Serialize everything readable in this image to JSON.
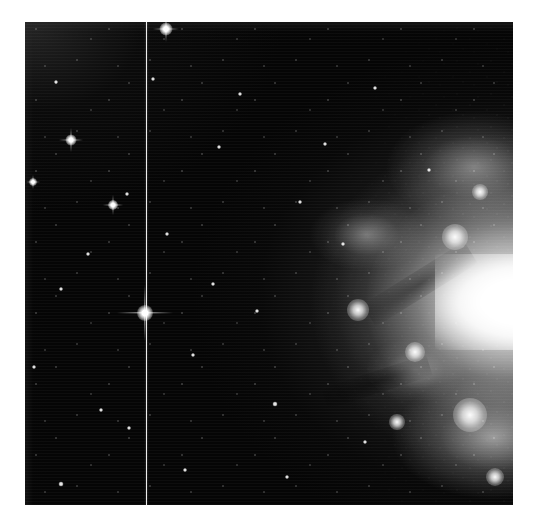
{
  "image": {
    "kind": "astronomical-photograph",
    "palette": "grayscale",
    "background_color": "#ffffff",
    "sky_color": "#050505",
    "highlight_color": "#ffffff",
    "frame": {
      "left": 25,
      "top": 22,
      "width": 488,
      "height": 483
    },
    "canvas": {
      "width": 535,
      "height": 526
    }
  },
  "features": {
    "nebula": {
      "label": "bright-galaxy-glow",
      "core_x_pct": 99,
      "core_y_pct": 58,
      "description": "saturated white core at right edge with diffuse halo fading to the left"
    },
    "column_artifact": {
      "label": "vertical-detector-column",
      "x": 121,
      "color": "#ececec"
    },
    "bright_stars": [
      {
        "name": "star-top-center",
        "x": 141,
        "y": 7,
        "size": 13,
        "spike": 26,
        "thickness": 1
      },
      {
        "name": "star-upper-left",
        "x": 46,
        "y": 118,
        "size": 11,
        "spike": 24,
        "thickness": 1
      },
      {
        "name": "star-left-mid",
        "x": 88,
        "y": 183,
        "size": 10,
        "spike": 20,
        "thickness": 1
      },
      {
        "name": "star-center-left",
        "x": 120,
        "y": 291,
        "size": 16,
        "spike": 56,
        "thickness": 1.4
      },
      {
        "name": "star-left-edge",
        "x": 8,
        "y": 160,
        "size": 8,
        "spike": 14,
        "thickness": 1
      }
    ],
    "medium_stars": [
      {
        "x": 31,
        "y": 60,
        "size": 4
      },
      {
        "x": 63,
        "y": 232,
        "size": 4
      },
      {
        "x": 102,
        "y": 172,
        "size": 4
      },
      {
        "x": 36,
        "y": 267,
        "size": 4
      },
      {
        "x": 9,
        "y": 345,
        "size": 4
      },
      {
        "x": 104,
        "y": 406,
        "size": 4
      },
      {
        "x": 160,
        "y": 448,
        "size": 4
      },
      {
        "x": 36,
        "y": 462,
        "size": 5
      },
      {
        "x": 128,
        "y": 57,
        "size": 4
      },
      {
        "x": 194,
        "y": 125,
        "size": 4
      },
      {
        "x": 232,
        "y": 289,
        "size": 4
      },
      {
        "x": 250,
        "y": 382,
        "size": 5
      },
      {
        "x": 300,
        "y": 122,
        "size": 4
      },
      {
        "x": 318,
        "y": 222,
        "size": 4
      },
      {
        "x": 168,
        "y": 333,
        "size": 4
      },
      {
        "x": 215,
        "y": 72,
        "size": 4
      },
      {
        "x": 275,
        "y": 180,
        "size": 4
      },
      {
        "x": 350,
        "y": 66,
        "size": 4
      },
      {
        "x": 404,
        "y": 148,
        "size": 4
      },
      {
        "x": 76,
        "y": 388,
        "size": 4
      },
      {
        "x": 142,
        "y": 212,
        "size": 4
      },
      {
        "x": 262,
        "y": 455,
        "size": 4
      },
      {
        "x": 340,
        "y": 420,
        "size": 4
      },
      {
        "x": 188,
        "y": 262,
        "size": 4
      }
    ],
    "knots": [
      {
        "name": "knot-upper-galaxy",
        "x": 430,
        "y": 215,
        "size": 26
      },
      {
        "name": "knot-west-arm",
        "x": 333,
        "y": 288,
        "size": 22
      },
      {
        "name": "knot-lower-cluster",
        "x": 445,
        "y": 393,
        "size": 34
      },
      {
        "name": "knot-mid-galaxy",
        "x": 390,
        "y": 330,
        "size": 20
      },
      {
        "name": "knot-south-tip",
        "x": 470,
        "y": 455,
        "size": 18
      },
      {
        "name": "knot-north-rim",
        "x": 455,
        "y": 170,
        "size": 16
      },
      {
        "name": "knot-inner-west",
        "x": 372,
        "y": 400,
        "size": 16
      }
    ],
    "dust_lanes": [
      {
        "name": "dust-lane-upper",
        "x": 395,
        "y": 262,
        "w": 120,
        "h": 26,
        "rot": -32
      },
      {
        "name": "dust-lane-lower",
        "x": 352,
        "y": 360,
        "w": 110,
        "h": 22,
        "rot": -18
      }
    ]
  }
}
